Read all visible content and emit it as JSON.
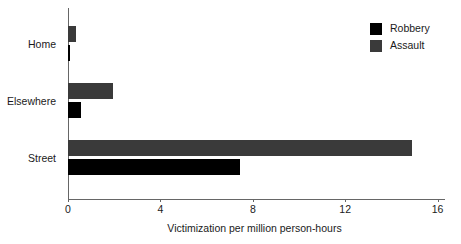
{
  "chart_data": {
    "type": "bar",
    "orientation": "horizontal",
    "title": "",
    "xlabel": "Victimization per million person-hours",
    "ylabel": "",
    "categories": [
      "Home",
      "Elsewhere",
      "Street"
    ],
    "series": [
      {
        "name": "Robbery",
        "color": "#000000",
        "values": [
          0.1,
          0.55,
          7.45
        ]
      },
      {
        "name": "Assault",
        "color": "#3a3a3a",
        "values": [
          0.35,
          1.95,
          14.9
        ]
      }
    ],
    "xlim": [
      0,
      16
    ],
    "xticks": [
      0,
      4,
      8,
      12,
      16
    ],
    "xtick_labels": [
      "0",
      "4",
      "8",
      "12",
      "16"
    ],
    "grid": false,
    "legend_position": "top-right",
    "legend_entries": [
      "Robbery",
      "Assault"
    ]
  },
  "axis": {
    "x_title": "Victimization per million person-hours",
    "tick_labels": [
      "0",
      "4",
      "8",
      "12",
      "16"
    ],
    "category_labels": [
      "Home",
      "Elsewhere",
      "Street"
    ]
  },
  "legend": {
    "items": [
      {
        "label": "Robbery",
        "color": "#000000"
      },
      {
        "label": "Assault",
        "color": "#3a3a3a"
      }
    ]
  },
  "colors": {
    "robbery": "#000000",
    "assault": "#3a3a3a",
    "axis": "#666666",
    "text": "#1a1a1a",
    "background": "#ffffff"
  }
}
